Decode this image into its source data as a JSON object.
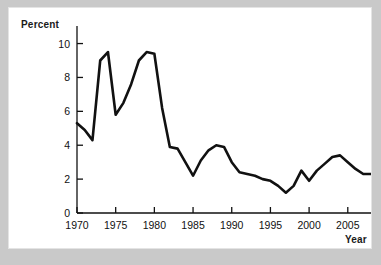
{
  "figure": {
    "background_color": "#c9c9c9",
    "panel_color": "#ffffff",
    "line_color": "#111111"
  },
  "labels": {
    "y_axis_title": "Percent",
    "x_axis_title": "Year"
  },
  "chart_data": {
    "type": "line",
    "title": "",
    "xlabel": "Year",
    "ylabel": "Percent",
    "xlim": [
      1970,
      2008
    ],
    "ylim": [
      0,
      10.8
    ],
    "xticks": [
      1970,
      1975,
      1980,
      1985,
      1990,
      1995,
      2000,
      2005
    ],
    "xtick_labels": [
      "1970",
      "1975",
      "1980",
      "1985",
      "1990",
      "1995",
      "2000",
      "2005"
    ],
    "yticks": [
      0,
      2,
      4,
      6,
      8,
      10
    ],
    "ytick_labels": [
      "0",
      "2",
      "4",
      "6",
      "8",
      "10"
    ],
    "grid": false,
    "legend": false,
    "series": [
      {
        "name": "Percent",
        "x": [
          1970,
          1971,
          1972,
          1973,
          1974,
          1975,
          1976,
          1977,
          1978,
          1979,
          1980,
          1981,
          1982,
          1983,
          1984,
          1985,
          1986,
          1987,
          1988,
          1989,
          1990,
          1991,
          1992,
          1993,
          1994,
          1995,
          1996,
          1997,
          1998,
          1999,
          2000,
          2001,
          2002,
          2003,
          2004,
          2005,
          2006,
          2007,
          2008
        ],
        "values": [
          5.3,
          4.9,
          4.3,
          9.0,
          9.5,
          5.8,
          6.5,
          7.6,
          9.0,
          9.5,
          9.4,
          6.2,
          3.9,
          3.8,
          3.0,
          2.2,
          3.1,
          3.7,
          4.0,
          3.9,
          3.0,
          2.4,
          2.3,
          2.2,
          2.0,
          1.9,
          1.6,
          1.2,
          1.6,
          2.5,
          1.9,
          2.5,
          2.9,
          3.3,
          3.4,
          3.0,
          2.6,
          2.3,
          2.3
        ]
      }
    ]
  },
  "axes_geometry": {
    "plot_left_px": 68,
    "plot_right_px": 362,
    "plot_top_px": 22,
    "plot_bottom_px": 205,
    "x_min": 1970,
    "x_max": 2008,
    "y_min": 0,
    "y_max": 10.8
  }
}
